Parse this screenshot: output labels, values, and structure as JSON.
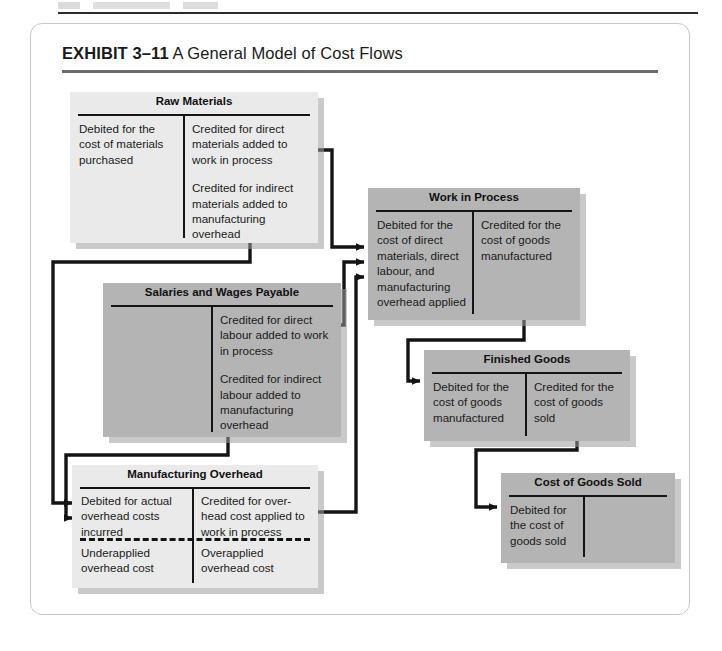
{
  "exhibit": {
    "label": "EXHIBIT 3–11",
    "title": " A General Model of Cost Flows"
  },
  "colors": {
    "box_light": "#eaeaea",
    "box_dark": "#b4b4b4",
    "rule": "#141414",
    "title_rule": "#6d6d6d",
    "shadow": "#9d9d9d"
  },
  "accounts": [
    {
      "id": "raw-materials",
      "title": "Raw Materials",
      "shade": "light",
      "debit": [
        "Debited for the cost of materials purchased"
      ],
      "credit": [
        "Credited for direct materials added to work in process",
        "Credited for indirect materials added to manufacturing overhead"
      ],
      "dashed_divider": false
    },
    {
      "id": "salaries-and-wages-payable",
      "title": "Salaries and Wages Payable",
      "shade": "dark",
      "debit": [],
      "credit": [
        "Credited for direct labour added to work in process",
        "Credited for indirect labour added to manufacturing overhead"
      ],
      "dashed_divider": false
    },
    {
      "id": "manufacturing-overhead",
      "title": "Manufacturing Overhead",
      "shade": "light",
      "debit": [
        "Debited for actual overhead costs incurred"
      ],
      "credit": [
        "Credited for over-head cost applied to work in process"
      ],
      "debit_below": [
        "Underapplied overhead cost"
      ],
      "credit_below": [
        "Overapplied overhead cost"
      ],
      "dashed_divider": true
    },
    {
      "id": "work-in-process",
      "title": "Work in Process",
      "shade": "dark",
      "debit": [
        "Debited for the cost of direct materials, direct labour, and manufacturing overhead applied"
      ],
      "credit": [
        "Credited for the cost of goods manufactured"
      ],
      "dashed_divider": false
    },
    {
      "id": "finished-goods",
      "title": "Finished Goods",
      "shade": "dark",
      "debit": [
        "Debited for the cost of goods manufactured"
      ],
      "credit": [
        "Credited for the cost of goods sold"
      ],
      "dashed_divider": false
    },
    {
      "id": "cost-of-goods-sold",
      "title": "Cost of Goods Sold",
      "shade": "dark",
      "debit": [
        "Debited for the cost of goods sold"
      ],
      "credit": [],
      "dashed_divider": false
    }
  ],
  "flows": [
    {
      "from": "raw-materials",
      "to": "work-in-process",
      "label": "direct materials to work in process"
    },
    {
      "from": "raw-materials",
      "to": "manufacturing-overhead",
      "label": "indirect materials to manufacturing overhead"
    },
    {
      "from": "salaries-and-wages-payable",
      "to": "work-in-process",
      "label": "direct labour to work in process"
    },
    {
      "from": "salaries-and-wages-payable",
      "to": "manufacturing-overhead",
      "label": "indirect labour to manufacturing overhead"
    },
    {
      "from": "manufacturing-overhead",
      "to": "work-in-process",
      "label": "overhead applied to work in process"
    },
    {
      "from": "work-in-process",
      "to": "finished-goods",
      "label": "cost of goods manufactured"
    },
    {
      "from": "finished-goods",
      "to": "cost-of-goods-sold",
      "label": "cost of goods sold"
    }
  ]
}
